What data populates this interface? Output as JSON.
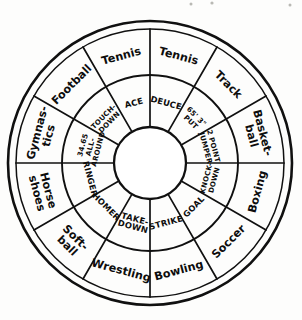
{
  "figure": {
    "name": "sports-terminology-wheel",
    "center_hub_text": "",
    "ink_color": "#101010",
    "paper_color": "#fdfdfc",
    "sector_count": 12,
    "ring_count": 2
  },
  "chart_data": {
    "type": "pie",
    "title": "",
    "xlabel": "",
    "ylabel": "",
    "legend_position": "none",
    "grid": false,
    "categories": [
      "Tennis",
      "Track",
      "Basket-ball",
      "Boxing",
      "Soccer",
      "Bowling",
      "Wrestling",
      "Soft-ball",
      "Horse shoes",
      "Gymnas-tics",
      "Football",
      "Tennis"
    ],
    "values": [
      30,
      30,
      30,
      30,
      30,
      30,
      30,
      30,
      30,
      30,
      30,
      30
    ],
    "series": [
      {
        "name": "outer_ring_sport",
        "values": [
          "Tennis",
          "Track",
          "Basket-ball",
          "Boxing",
          "Soccer",
          "Bowling",
          "Wrestling",
          "Soft-ball",
          "Horse shoes",
          "Gymnas-tics",
          "Football",
          "Tennis"
        ]
      },
      {
        "name": "inner_ring_term",
        "values": [
          "DEUCE",
          "65' 3\" PUT",
          "2 POINT JUMPER",
          "KNOCK-DOWN",
          "GOAL",
          "STRIKE",
          "TAKE-DOWN",
          "HOMER",
          "RINGER",
          "34.65 ALL-AROUND",
          "TOUCH-DOWN",
          "ACE"
        ]
      }
    ]
  },
  "sectors": [
    {
      "id": "tennis-deuce",
      "outer_label": "Tennis",
      "inner_label": "DEUCE",
      "inner_lines": [
        "DEUCE"
      ],
      "start_angle": 0,
      "end_angle": 30
    },
    {
      "id": "track-shot-put",
      "outer_label": "Track",
      "inner_label": "65' 3\" PUT",
      "inner_lines": [
        "65' 3\"",
        "PUT"
      ],
      "start_angle": 30,
      "end_angle": 60
    },
    {
      "id": "basketball-jumper",
      "outer_label": "Basket-ball",
      "inner_label": "2 POINT JUMPER",
      "inner_lines": [
        "2 POINT",
        "JUMPER"
      ],
      "start_angle": 60,
      "end_angle": 90
    },
    {
      "id": "boxing-knockdown",
      "outer_label": "Boxing",
      "inner_label": "KNOCK-DOWN",
      "inner_lines": [
        "KNOCK-",
        "DOWN"
      ],
      "start_angle": 90,
      "end_angle": 120
    },
    {
      "id": "soccer-goal",
      "outer_label": "Soccer",
      "inner_label": "GOAL",
      "inner_lines": [
        "GOAL"
      ],
      "start_angle": 120,
      "end_angle": 150
    },
    {
      "id": "bowling-strike",
      "outer_label": "Bowling",
      "inner_label": "STRIKE",
      "inner_lines": [
        "STRIKE"
      ],
      "start_angle": 150,
      "end_angle": 180
    },
    {
      "id": "wrestling-takedown",
      "outer_label": "Wrestling",
      "inner_label": "TAKE-DOWN",
      "inner_lines": [
        "TAKE-",
        "DOWN"
      ],
      "start_angle": 180,
      "end_angle": 210
    },
    {
      "id": "softball-homer",
      "outer_label": "Soft-ball",
      "inner_label": "HOMER",
      "inner_lines": [
        "HOMER"
      ],
      "start_angle": 210,
      "end_angle": 240
    },
    {
      "id": "horseshoes-ringer",
      "outer_label": "Horse shoes",
      "inner_label": "RINGER",
      "inner_lines": [
        "RINGER"
      ],
      "start_angle": 240,
      "end_angle": 270
    },
    {
      "id": "gymnastics-all-around",
      "outer_label": "Gymnas-tics",
      "inner_label": "34.65 ALL-AROUND",
      "inner_lines": [
        "34.65",
        "ALL-",
        "AROUND"
      ],
      "start_angle": 270,
      "end_angle": 300
    },
    {
      "id": "football-touchdown",
      "outer_label": "Football",
      "inner_label": "TOUCH-DOWN",
      "inner_lines": [
        "TOUCH-",
        "DOWN"
      ],
      "start_angle": 300,
      "end_angle": 330
    },
    {
      "id": "tennis-ace",
      "outer_label": "Tennis",
      "inner_label": "ACE",
      "inner_lines": [
        "ACE"
      ],
      "start_angle": 330,
      "end_angle": 360
    }
  ],
  "geometry": {
    "center_x": 150,
    "center_y": 163,
    "rim_outer_radius": 142,
    "rim_inner_radius": 134,
    "ring_divide_radius": 88,
    "hub_radius": 36,
    "outer_label_radius": 111,
    "inner_label_radius": 62
  }
}
